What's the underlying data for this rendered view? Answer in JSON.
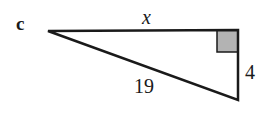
{
  "problem_label": "c",
  "triangle": {
    "type": "right-triangle",
    "side_top_label": "x",
    "hypotenuse_label": "19",
    "side_right_label": "4",
    "right_angle_marker_color": "#b3b3b3",
    "stroke_color": "#1a1a1a"
  }
}
